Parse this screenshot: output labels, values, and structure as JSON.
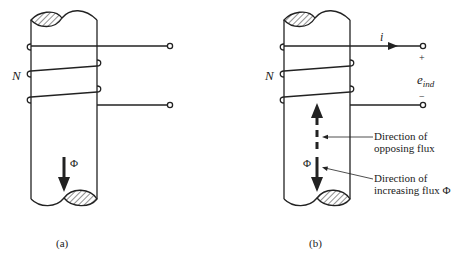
{
  "figure_a": {
    "caption": "(a)",
    "turns_label": "N",
    "flux_label": "Φ"
  },
  "figure_b": {
    "caption": "(b)",
    "turns_label": "N",
    "current_label": "i",
    "plus_label": "+",
    "minus_label": "−",
    "emf_label_main": "e",
    "emf_label_sub": "ind",
    "flux_label": "Φ",
    "opposing_line1": "Direction of",
    "opposing_line2": "opposing flux",
    "increasing_line1": "Direction of",
    "increasing_line2": "increasing flux Φ"
  },
  "colors": {
    "ink": "#222222",
    "background": "#ffffff"
  }
}
